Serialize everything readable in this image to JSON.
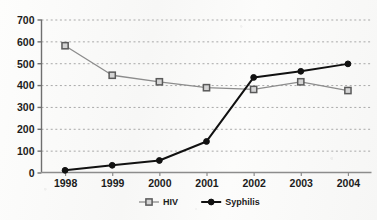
{
  "chart_data": {
    "type": "line",
    "title": "",
    "subtitle": "",
    "xlabel": "",
    "ylabel": "",
    "categories": [
      "1998",
      "1999",
      "2000",
      "2001",
      "2002",
      "2003",
      "2004"
    ],
    "x_tick_labels": [
      "1998",
      "1999",
      "2000",
      "2001",
      "2002",
      "2003",
      "2004"
    ],
    "y_tick_labels": [
      "0",
      "100",
      "200",
      "300",
      "400",
      "500",
      "600",
      "700"
    ],
    "y_ticks": [
      0,
      100,
      200,
      300,
      400,
      500,
      600,
      700
    ],
    "ylim": [
      0,
      700
    ],
    "grid": "horizontal-dashed",
    "legend_position": "bottom-center",
    "series": [
      {
        "name": "HIV",
        "values": [
          580,
          445,
          415,
          388,
          380,
          415,
          375
        ],
        "color": "#8c8c8c",
        "marker": "open-square",
        "marker_fill": "#d4d4d4",
        "marker_edge": "#5a5a5a"
      },
      {
        "name": "Syphilis",
        "values": [
          10,
          33,
          55,
          142,
          435,
          463,
          497
        ],
        "color": "#111111",
        "marker": "filled-circle",
        "marker_fill": "#111111",
        "marker_edge": "#111111"
      }
    ]
  },
  "legend": {
    "items": [
      {
        "label": "HIV"
      },
      {
        "label": "Syphilis"
      }
    ]
  },
  "axes": {
    "axis_color": "#6f6f6f",
    "grid_color": "#a9a9a9",
    "background": "#fbfbfa"
  }
}
